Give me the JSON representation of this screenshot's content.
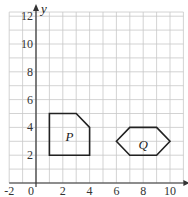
{
  "diagram": {
    "type": "coordinate-grid",
    "x_axis": {
      "min": -2,
      "max": 11,
      "tick_labels": [
        "-2",
        "0",
        "2",
        "4",
        "6",
        "8",
        "10"
      ],
      "tick_values": [
        -2,
        0,
        2,
        4,
        6,
        8,
        10
      ]
    },
    "y_axis": {
      "label": "y",
      "min": 0,
      "max": 12.3,
      "tick_labels": [
        "2",
        "4",
        "6",
        "8",
        "10",
        "12"
      ],
      "tick_values": [
        2,
        4,
        6,
        8,
        10,
        12
      ]
    },
    "shapes": [
      {
        "label": "P",
        "vertices": [
          [
            1,
            2
          ],
          [
            1,
            5
          ],
          [
            3,
            5
          ],
          [
            4,
            4
          ],
          [
            4,
            2
          ]
        ],
        "label_pos": [
          2.5,
          3.3
        ]
      },
      {
        "label": "Q",
        "vertices": [
          [
            6,
            3
          ],
          [
            7,
            4
          ],
          [
            9,
            4
          ],
          [
            10,
            3
          ],
          [
            9,
            2
          ],
          [
            7,
            2
          ]
        ],
        "label_pos": [
          8,
          2.7
        ]
      }
    ],
    "colors": {
      "grid": "#c8c8c8",
      "axis": "#333333",
      "shape": "#222222"
    }
  }
}
